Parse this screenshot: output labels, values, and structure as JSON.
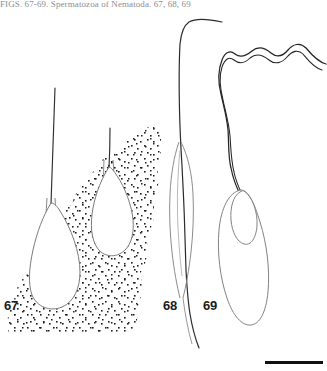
{
  "plate": {
    "kind": "scientific-figure-plate",
    "width": 327,
    "height": 371,
    "background_color": "#ffffff",
    "ink_color": "#3a3a3a",
    "caption_text": "FIGS. 67-69. Spermatozoa of Nematoda. 67, 68, 69"
  },
  "figures": [
    {
      "number": "67",
      "label": "67",
      "subject": "spermatozoon with pear-shaped head and stippled background",
      "head_shape": "pyriform",
      "flagellum": "single thin straight filament",
      "background": "stippled"
    },
    {
      "number": "68",
      "label": "68",
      "subject": "spermatozoon with elongate spindle-shaped head",
      "head_shape": "elongate-fusiform",
      "flagellum": "very long curved filament",
      "background": "plain"
    },
    {
      "number": "69",
      "label": "69",
      "subject": "spermatozoon with elongate oval head and inner acrosomal oval",
      "head_shape": "elongate-oval",
      "flagellum": "thick undulating double-contour filament",
      "background": "plain"
    }
  ],
  "scale_bar": {
    "name": "scale-bar",
    "color": "#111111",
    "length_px": 58,
    "thickness_px": 3,
    "caption": ""
  }
}
